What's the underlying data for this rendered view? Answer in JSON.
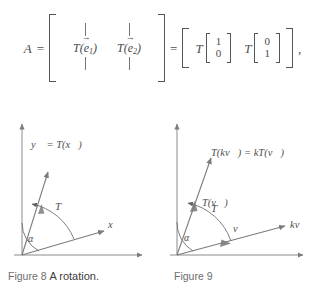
{
  "equation": {
    "lhs_symbol": "A",
    "equals_1": "=",
    "matrix_columns": {
      "top_bars": [
        "|",
        "|"
      ],
      "entries": [
        "T(e⃗1)",
        "T(e⃗2)"
      ],
      "entry_1": {
        "func": "T",
        "open": "(",
        "vec": "e",
        "sub": "1",
        "close": ")"
      },
      "entry_2": {
        "func": "T",
        "open": "(",
        "vec": "e",
        "sub": "2",
        "close": ")"
      },
      "bottom_bars": [
        "|",
        "|"
      ]
    },
    "equals_2": "=",
    "rhs": {
      "term_1": {
        "func": "T",
        "vector": [
          "1",
          "0"
        ]
      },
      "term_2": {
        "func": "T",
        "vector": [
          "0",
          "1"
        ]
      }
    },
    "trailing_punctuation": ","
  },
  "figure_8": {
    "caption_name": "Figure 8",
    "caption_text": "A rotation.",
    "labels": {
      "image_vector": "y⃗ = T(x⃗)",
      "source_vector": "x⃗",
      "transformation": "T",
      "angle": "α"
    },
    "colors": {
      "axis": "#8a8a8a",
      "vector": "#7c7c7c",
      "arc": "#6f6f6f"
    }
  },
  "figure_9": {
    "caption_name": "Figure 9",
    "caption_text": "",
    "labels": {
      "scaled_image_vector": "T(kv⃗) = kT(v⃗)",
      "image_vector": "T(v⃗)",
      "source_vector": "v⃗",
      "scaled_source_vector": "kv⃗",
      "transformation": "T",
      "angle": "α"
    },
    "colors": {
      "axis": "#8a8a8a",
      "vector": "#7c7c7c",
      "arc": "#6f6f6f"
    }
  },
  "page": {
    "background": "#ffffff",
    "text_color": "#4a4a4a"
  }
}
